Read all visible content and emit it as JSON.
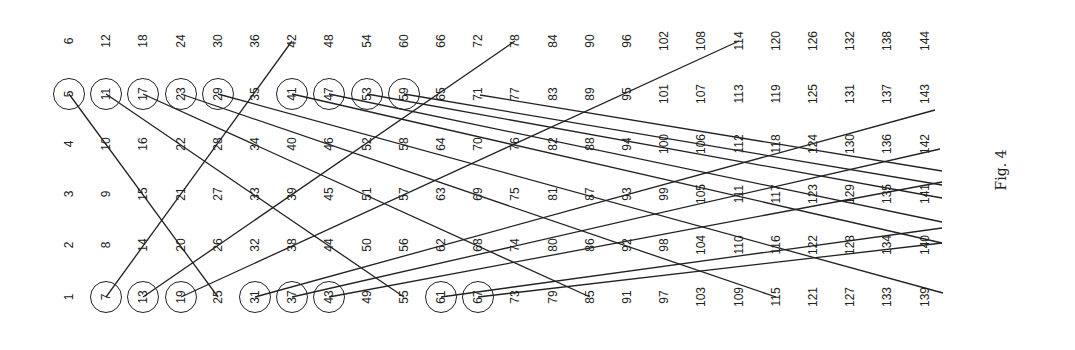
{
  "caption": "Fig. 4",
  "grid": {
    "columns": 24,
    "rows": 6,
    "col_x0": 69,
    "col_dx": 37.2,
    "row_y": [
      297,
      245,
      194,
      144,
      94,
      41
    ],
    "circled": [
      5,
      7,
      11,
      13,
      17,
      19,
      23,
      29,
      31,
      37,
      41,
      43,
      47,
      53,
      59,
      61,
      67
    ]
  },
  "lines": [
    {
      "from": 5,
      "x1": 69,
      "y1": 94,
      "x2": 218,
      "y2": 297
    },
    {
      "from": 7,
      "x1": 106,
      "y1": 297,
      "x2": 292,
      "y2": 41
    },
    {
      "from": 11,
      "x1": 106,
      "y1": 94,
      "x2": 404,
      "y2": 297
    },
    {
      "from": 13,
      "x1": 143,
      "y1": 297,
      "x2": 515,
      "y2": 41
    },
    {
      "from": 17,
      "x1": 143,
      "y1": 94,
      "x2": 590,
      "y2": 297
    },
    {
      "from": 19,
      "x1": 181,
      "y1": 297,
      "x2": 739,
      "y2": 41
    },
    {
      "from": 23,
      "x1": 181,
      "y1": 94,
      "x2": 776,
      "y2": 297
    },
    {
      "from": 29,
      "x1": 218,
      "y1": 94,
      "x2": 943,
      "y2": 293
    },
    {
      "from": 31,
      "x1": 255,
      "y1": 297,
      "x2": 935,
      "y2": 110
    },
    {
      "from": 37,
      "x1": 292,
      "y1": 297,
      "x2": 940,
      "y2": 149
    },
    {
      "from": 41,
      "x1": 292,
      "y1": 94,
      "x2": 942,
      "y2": 243
    },
    {
      "from": 43,
      "x1": 329,
      "y1": 297,
      "x2": 942,
      "y2": 182
    },
    {
      "from": 47,
      "x1": 329,
      "y1": 94,
      "x2": 942,
      "y2": 222
    },
    {
      "from": 53,
      "x1": 367,
      "y1": 94,
      "x2": 942,
      "y2": 198
    },
    {
      "from": 59,
      "x1": 404,
      "y1": 94,
      "x2": 942,
      "y2": 185
    },
    {
      "from": 61,
      "x1": 441,
      "y1": 297,
      "x2": 942,
      "y2": 228
    },
    {
      "from": 67,
      "x1": 478,
      "y1": 297,
      "x2": 942,
      "y2": 243
    },
    {
      "from": 71,
      "x1": 480,
      "y1": 95,
      "x2": 942,
      "y2": 171
    }
  ]
}
